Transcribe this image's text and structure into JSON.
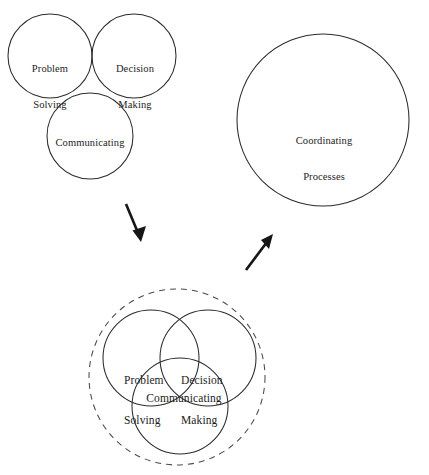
{
  "figure": {
    "background_color": "#ffffff",
    "stroke_color": "#2b2b2b",
    "dashed_stroke_color": "#4a4a4a",
    "arrow_color": "#161616",
    "groups": {
      "top_left": {
        "name": "separate-processes-group",
        "circles": [
          {
            "id": "problem-solving",
            "label": "Problem\nSolving",
            "cx": 50,
            "cy": 56,
            "r": 42
          },
          {
            "id": "decision-making",
            "label": "Decision\nMaking",
            "cx": 134,
            "cy": 56,
            "r": 42
          },
          {
            "id": "communicating",
            "label": "Communicating",
            "cx": 90,
            "cy": 136,
            "r": 43
          }
        ]
      },
      "top_right": {
        "name": "coordinating-processes-group",
        "circles": [
          {
            "id": "coordinating-processes",
            "label": "Coordinating\nProcesses",
            "cx": 323,
            "cy": 120,
            "r": 86
          }
        ]
      },
      "bottom": {
        "name": "integrated-processes-group",
        "outer_circle": {
          "id": "coordination-boundary",
          "cx": 177,
          "cy": 377,
          "r": 88,
          "style": "dashed"
        },
        "circles": [
          {
            "id": "problem-solving",
            "label": "Problem\nSolving",
            "cx": 151,
            "cy": 358,
            "r": 48
          },
          {
            "id": "decision-making",
            "label": "Decision\nMaking",
            "cx": 208,
            "cy": 358,
            "r": 48
          },
          {
            "id": "communicating",
            "label": "Communicating",
            "cx": 180,
            "cy": 406,
            "r": 48
          }
        ]
      }
    },
    "arrows": [
      {
        "id": "arrow-down-left",
        "direction": "down-right",
        "x1": 126,
        "y1": 204,
        "x2": 141,
        "y2": 241
      },
      {
        "id": "arrow-up-right",
        "direction": "up-right",
        "x1": 246,
        "y1": 270,
        "x2": 273,
        "y2": 235
      }
    ],
    "labels": {
      "problem_solving_line1": "Problem",
      "problem_solving_line2": "Solving",
      "decision_making_line1": "Decision",
      "decision_making_line2": "Making",
      "communicating": "Communicating",
      "coordinating_line1": "Coordinating",
      "coordinating_line2": "Processes"
    }
  }
}
